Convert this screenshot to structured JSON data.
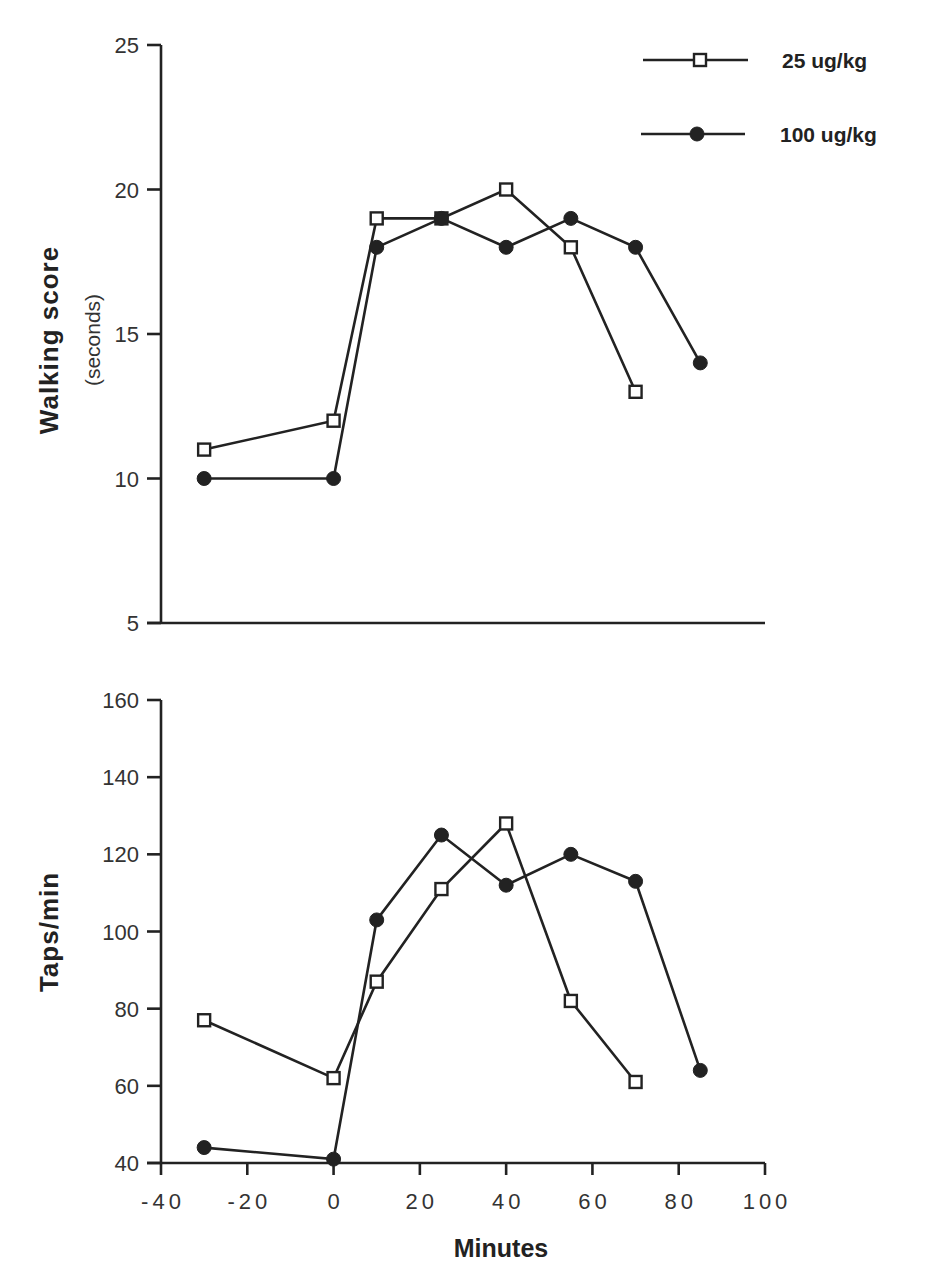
{
  "figure": {
    "legend": [
      {
        "label": "25 ug/kg",
        "marker": "open-square"
      },
      {
        "label": "100 ug/kg",
        "marker": "filled-circle"
      }
    ],
    "xlabel": "Minutes"
  },
  "chart_data": [
    {
      "type": "line",
      "title": "",
      "ylabel": "Walking score",
      "ylabel_sub": "(seconds)",
      "xlabel": "",
      "ylim": [
        5,
        25
      ],
      "yticks": [
        5,
        10,
        15,
        20,
        25
      ],
      "xlim": [
        -40,
        100
      ],
      "xticks_visible": false,
      "grid": false,
      "legend_position": "top-right",
      "series": [
        {
          "name": "25 ug/kg",
          "marker": "open-square",
          "x": [
            -30,
            0,
            10,
            25,
            40,
            55,
            70
          ],
          "y": [
            11,
            12,
            19,
            19,
            20,
            18,
            13
          ]
        },
        {
          "name": "100 ug/kg",
          "marker": "filled-circle",
          "x": [
            -30,
            0,
            10,
            25,
            40,
            55,
            70,
            85
          ],
          "y": [
            10,
            10,
            18,
            19,
            18,
            19,
            18,
            14
          ]
        }
      ]
    },
    {
      "type": "line",
      "title": "",
      "ylabel": "Taps/min",
      "xlabel": "Minutes",
      "ylim": [
        40,
        160
      ],
      "yticks": [
        40,
        60,
        80,
        100,
        120,
        140,
        160
      ],
      "xlim": [
        -40,
        100
      ],
      "xticks": [
        -40,
        -20,
        0,
        20,
        40,
        60,
        80,
        100
      ],
      "grid": false,
      "series": [
        {
          "name": "25 ug/kg",
          "marker": "open-square",
          "x": [
            -30,
            0,
            10,
            25,
            40,
            55,
            70
          ],
          "y": [
            77,
            62,
            87,
            111,
            128,
            82,
            61
          ]
        },
        {
          "name": "100 ug/kg",
          "marker": "filled-circle",
          "x": [
            -30,
            0,
            10,
            25,
            40,
            55,
            70,
            85
          ],
          "y": [
            44,
            41,
            103,
            125,
            112,
            120,
            113,
            64
          ]
        }
      ]
    }
  ]
}
